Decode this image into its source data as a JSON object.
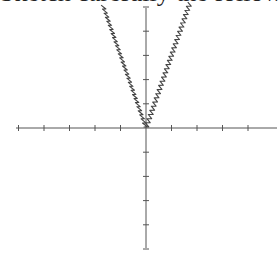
{
  "header": {
    "clipped_text": "Sketch carefully the following graph"
  },
  "chart_data": {
    "type": "line",
    "title": "",
    "xlabel": "",
    "ylabel": "",
    "function_approx": "y = 3|x|",
    "xlim": [
      -5,
      5.2
    ],
    "ylim": [
      -5,
      5
    ],
    "x_ticks": [
      -5,
      -4,
      -3,
      -2,
      -1,
      1,
      2,
      3,
      4
    ],
    "y_ticks": [
      -5,
      -4,
      -3,
      -2,
      -1,
      1,
      2,
      3,
      4,
      5
    ],
    "tick_labels_shown": false,
    "grid": false,
    "legend": null,
    "series": [
      {
        "name": "graph",
        "x": [
          -1.65,
          -1.2,
          -0.8,
          -0.4,
          0,
          0.4,
          0.8,
          1.2,
          1.7
        ],
        "y": [
          5,
          3.6,
          2.4,
          1.2,
          0,
          1.2,
          2.4,
          3.6,
          5
        ]
      }
    ],
    "colors": {
      "axis": "#555555",
      "curve": "#444444"
    }
  },
  "layout": {
    "origin_px": [
      146,
      128
    ],
    "x_unit_px": 25.5,
    "y_unit_px": 24.2,
    "x_axis_px": [
      16,
      277
    ],
    "y_axis_px": [
      8,
      248
    ]
  }
}
